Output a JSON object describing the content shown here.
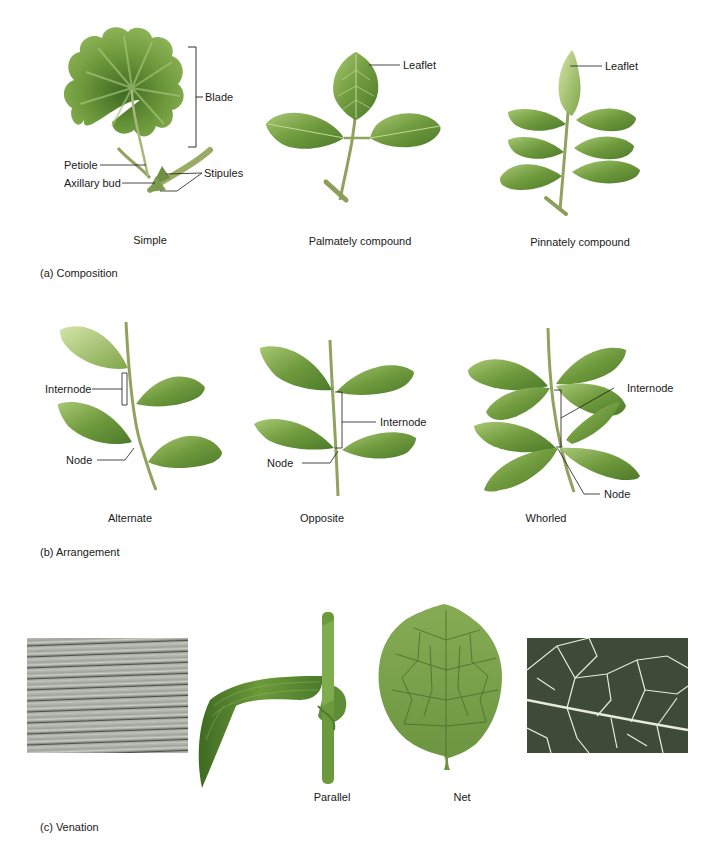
{
  "figure": {
    "sections": [
      {
        "id": "composition",
        "title": "(a) Composition",
        "panels": [
          {
            "caption": "Simple",
            "labels": [
              "Blade",
              "Petiole",
              "Axillary bud",
              "Stipules"
            ]
          },
          {
            "caption": "Palmately compound",
            "labels": [
              "Leaflet"
            ]
          },
          {
            "caption": "Pinnately compound",
            "labels": [
              "Leaflet"
            ]
          }
        ]
      },
      {
        "id": "arrangement",
        "title": "(b) Arrangement",
        "panels": [
          {
            "caption": "Alternate",
            "labels": [
              "Internode",
              "Node"
            ]
          },
          {
            "caption": "Opposite",
            "labels": [
              "Internode",
              "Node"
            ]
          },
          {
            "caption": "Whorled",
            "labels": [
              "Internode",
              "Node"
            ]
          }
        ]
      },
      {
        "id": "venation",
        "title": "(c) Venation",
        "panels": [
          {
            "caption": "Parallel"
          },
          {
            "caption": "Net"
          }
        ]
      }
    ]
  },
  "colors": {
    "leaf_dark": "#4f7a2e",
    "leaf_mid": "#7ea34a",
    "leaf_light": "#b5cf7e",
    "stem": "#8a9a58",
    "line": "#1a1a1a",
    "micro_parallel": "#8a8f88",
    "micro_net_bg": "#3c4a36",
    "micro_net_vein": "#e8efe0"
  }
}
